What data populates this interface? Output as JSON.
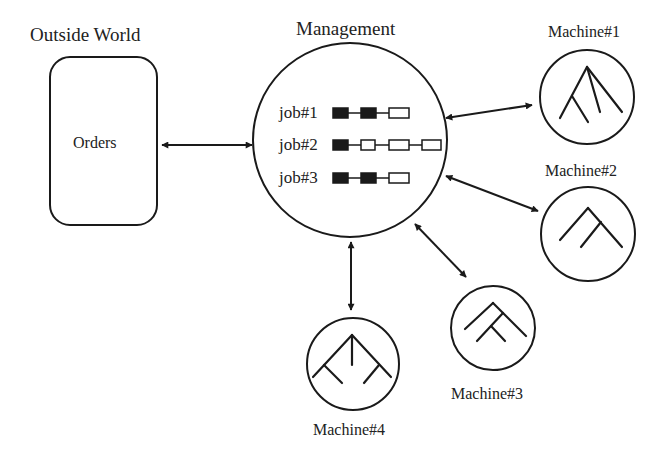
{
  "outside_world": {
    "title": "Outside World",
    "box_label": "Orders"
  },
  "management": {
    "title": "Management",
    "jobs": [
      {
        "label": "job#1",
        "ops": [
          "done",
          "done",
          "pending"
        ]
      },
      {
        "label": "job#2",
        "ops": [
          "done",
          "pending",
          "pending",
          "pending"
        ]
      },
      {
        "label": "job#3",
        "ops": [
          "done",
          "done",
          "pending"
        ]
      }
    ]
  },
  "machines": [
    {
      "label": "Machine#1",
      "icon": "tree-icon-three-branch"
    },
    {
      "label": "Machine#2",
      "icon": "tree-icon-nested-chevron"
    },
    {
      "label": "Machine#3",
      "icon": "tree-icon-nested-chevron-small"
    },
    {
      "label": "Machine#4",
      "icon": "tree-icon-double-branch"
    }
  ],
  "connections": [
    {
      "from": "Outside World",
      "to": "Management",
      "type": "bidirectional"
    },
    {
      "from": "Management",
      "to": "Machine#1",
      "type": "bidirectional"
    },
    {
      "from": "Management",
      "to": "Machine#2",
      "type": "bidirectional"
    },
    {
      "from": "Management",
      "to": "Machine#3",
      "type": "bidirectional"
    },
    {
      "from": "Management",
      "to": "Machine#4",
      "type": "bidirectional"
    }
  ],
  "colors": {
    "stroke": "#1a1a1a",
    "background": "#ffffff"
  }
}
